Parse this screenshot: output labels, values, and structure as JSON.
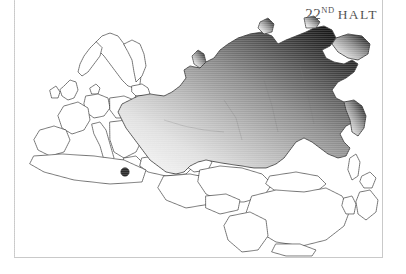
{
  "page": {
    "width": 406,
    "height": 274,
    "background_color": "#ffffff"
  },
  "title": {
    "number": "22",
    "ordinal_suffix": "ND",
    "word": "HALT",
    "full_text": "22ND HALT",
    "color": "#4a4a4a"
  },
  "frame": {
    "color": "#c9c9c9",
    "sides_drawn": "left, right, bottom"
  },
  "map": {
    "region": "Northern Eurasia",
    "highlighted_country": "Russia",
    "outline_color": "#3a3a3a",
    "land_fill_color": "#ffffff",
    "highlight_gradient": {
      "type": "linear",
      "direction": "southwest to northeast",
      "from_color": "#f2f2f2",
      "mid_color": "#9a9a9a",
      "to_color": "#1b1b1b"
    },
    "texture": "horizontal scanlines",
    "marker": {
      "name": "city-marker",
      "color": "#2b2b2b",
      "x": 111,
      "y": 172,
      "radius": 4.2
    },
    "neighbor_countries": [
      "Norway",
      "Sweden",
      "Finland",
      "Estonia",
      "Latvia",
      "Lithuania",
      "Belarus",
      "Ukraine",
      "Poland",
      "Germany",
      "France",
      "Spain",
      "Italy",
      "Turkey",
      "Kazakhstan",
      "Uzbekistan",
      "Turkmenistan",
      "Mongolia",
      "China",
      "Japan",
      "North Korea",
      "South Korea"
    ]
  }
}
